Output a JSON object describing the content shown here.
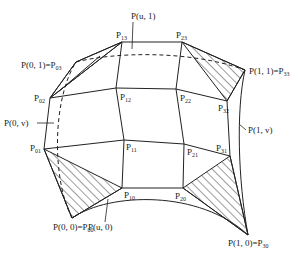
{
  "diagram": {
    "type": "bicubic-bezier-surface-control-net",
    "control_points": [
      {
        "id": "P00",
        "label": "P",
        "sub": "00",
        "x": 72,
        "y": 218
      },
      {
        "id": "P10",
        "label": "P",
        "sub": "10",
        "x": 122,
        "y": 188
      },
      {
        "id": "P20",
        "label": "P",
        "sub": "20",
        "x": 183,
        "y": 188
      },
      {
        "id": "P30",
        "label": "P",
        "sub": "30",
        "x": 248,
        "y": 235
      },
      {
        "id": "P01",
        "label": "P",
        "sub": "01",
        "x": 44,
        "y": 149
      },
      {
        "id": "P11",
        "label": "P",
        "sub": "11",
        "x": 124,
        "y": 140
      },
      {
        "id": "P21",
        "label": "P",
        "sub": "21",
        "x": 184,
        "y": 144
      },
      {
        "id": "P31",
        "label": "P",
        "sub": "31",
        "x": 230,
        "y": 156
      },
      {
        "id": "P02",
        "label": "P",
        "sub": "02",
        "x": 50,
        "y": 98
      },
      {
        "id": "P12",
        "label": "P",
        "sub": "12",
        "x": 116,
        "y": 88
      },
      {
        "id": "P22",
        "label": "P",
        "sub": "22",
        "x": 176,
        "y": 89
      },
      {
        "id": "P32",
        "label": "P",
        "sub": "32",
        "x": 227,
        "y": 101
      },
      {
        "id": "P03",
        "label": "P",
        "sub": "03",
        "x": 76,
        "y": 62
      },
      {
        "id": "P13",
        "label": "P",
        "sub": "13",
        "x": 122,
        "y": 42
      },
      {
        "id": "P23",
        "label": "P",
        "sub": "23",
        "x": 182,
        "y": 42
      },
      {
        "id": "P33",
        "label": "P",
        "sub": "33",
        "x": 245,
        "y": 70
      }
    ],
    "labels": {
      "p13": {
        "main": "P",
        "sub": "13"
      },
      "p23": {
        "main": "P",
        "sub": "23"
      },
      "p12": {
        "main": "P",
        "sub": "12"
      },
      "p22": {
        "main": "P",
        "sub": "22"
      },
      "p32": {
        "main": "P",
        "sub": "32"
      },
      "p11": {
        "main": "P",
        "sub": "11"
      },
      "p21": {
        "main": "P",
        "sub": "21"
      },
      "p31": {
        "main": "P",
        "sub": "31"
      },
      "p10": {
        "main": "P",
        "sub": "10"
      },
      "p20": {
        "main": "P",
        "sub": "20"
      },
      "p02": {
        "main": "P",
        "sub": "02"
      },
      "p01": {
        "main": "P",
        "sub": "01"
      },
      "corner_01": {
        "main": "P(0, 1)=P",
        "sub": "03"
      },
      "corner_11": {
        "main": "P(1, 1)=P",
        "sub": "33"
      },
      "corner_00": {
        "main": "P(0, 0)=P",
        "sub": "00"
      },
      "corner_10": {
        "main": "P(1, 0)=P",
        "sub": "30"
      },
      "boundary_u1": "P(u, 1)",
      "boundary_u0": "P(u, 0)",
      "boundary_0v": "P(0, v)",
      "boundary_1v": "P(1, v)"
    },
    "hatched_corner_triangles": [
      [
        "P00",
        "P01",
        "P10"
      ],
      [
        "P30",
        "P20",
        "P31"
      ],
      [
        "P33",
        "P23",
        "P32"
      ],
      [
        "P03",
        "P13",
        "P02"
      ]
    ],
    "colors": {
      "line": "#222222",
      "background": "#ffffff"
    }
  }
}
